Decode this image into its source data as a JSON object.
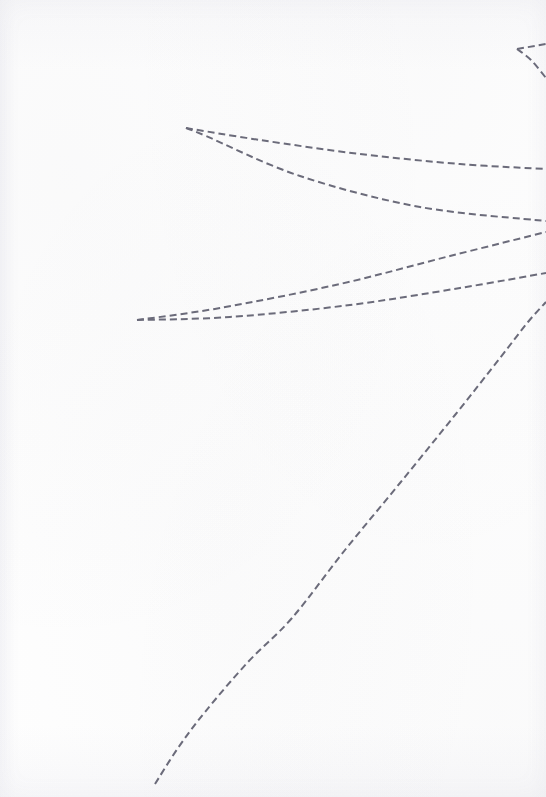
{
  "figure": {
    "width": 546,
    "height": 797,
    "background_color": "#fefefe",
    "stroke_color": "#6b6b7a",
    "stroke_width": 2,
    "dash_pattern": "7 4"
  },
  "chart_data": {
    "type": "line",
    "subtitle": "",
    "xlabel": "",
    "ylabel": "",
    "xlim": [
      0,
      546
    ],
    "ylim": [
      797,
      0
    ],
    "grid": false,
    "legend": "none",
    "axes_visible": false,
    "tick_labels": [],
    "annotations": [],
    "units": "pixels",
    "note": "Coordinates are image pixel coordinates; y increases downward.",
    "series": [
      {
        "name": "corner-spur-upper",
        "color": "#6b6b7a",
        "style": "dashed",
        "points": [
          [
            517,
            49
          ],
          [
            546,
            44
          ]
        ]
      },
      {
        "name": "corner-spur-lower",
        "color": "#6b6b7a",
        "style": "dashed",
        "points": [
          [
            517,
            49
          ],
          [
            531,
            60
          ],
          [
            546,
            78
          ]
        ]
      },
      {
        "name": "vein-1-upper",
        "color": "#6b6b7a",
        "style": "dashed",
        "points": [
          [
            186,
            128
          ],
          [
            260,
            140
          ],
          [
            360,
            154
          ],
          [
            460,
            164
          ],
          [
            546,
            169
          ]
        ]
      },
      {
        "name": "vein-1-lower",
        "color": "#6b6b7a",
        "style": "dashed",
        "points": [
          [
            186,
            128
          ],
          [
            206,
            136
          ],
          [
            300,
            176
          ],
          [
            420,
            207
          ],
          [
            546,
            221
          ]
        ]
      },
      {
        "name": "vein-2-upper",
        "color": "#6b6b7a",
        "style": "dashed",
        "points": [
          [
            137,
            320
          ],
          [
            220,
            308
          ],
          [
            340,
            284
          ],
          [
            450,
            256
          ],
          [
            546,
            232
          ]
        ]
      },
      {
        "name": "vein-2-lower",
        "color": "#6b6b7a",
        "style": "dashed",
        "points": [
          [
            137,
            320
          ],
          [
            230,
            317
          ],
          [
            350,
            305
          ],
          [
            460,
            288
          ],
          [
            546,
            273
          ]
        ]
      },
      {
        "name": "long-diagonal",
        "color": "#6b6b7a",
        "style": "dashed",
        "points": [
          [
            155,
            784
          ],
          [
            178,
            748
          ],
          [
            205,
            712
          ],
          [
            248,
            662
          ],
          [
            292,
            618
          ],
          [
            345,
            550
          ],
          [
            400,
            483
          ],
          [
            455,
            415
          ],
          [
            500,
            358
          ],
          [
            528,
            322
          ],
          [
            546,
            302
          ]
        ]
      }
    ]
  }
}
